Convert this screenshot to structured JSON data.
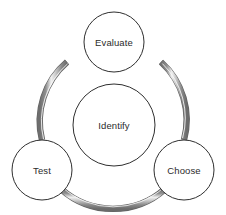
{
  "diagram": {
    "type": "cycle-diagram",
    "title": "",
    "background_color": "#ffffff",
    "stroke_color": "#2f2f2f",
    "text_color": "#2b2b2b",
    "ring": {
      "name": "connecting-ring",
      "color_dark": "#6e6e6e",
      "color_mid": "#9a9a9a",
      "color_highlight": "#f2f2f2",
      "center_x": 113,
      "center_y": 118,
      "radius": 78,
      "band_width": 6,
      "segments": [
        {
          "name": "arc-evaluate-to-choose",
          "start_angle": -52,
          "end_angle": 52
        },
        {
          "name": "arc-choose-to-test",
          "start_angle": 68,
          "end_angle": 112
        },
        {
          "name": "arc-test-to-evaluate",
          "start_angle": 128,
          "end_angle": 232
        }
      ]
    },
    "center_node": {
      "name": "identify",
      "label": "Identify",
      "cx": 114,
      "cy": 125,
      "r": 41
    },
    "nodes": [
      {
        "name": "evaluate",
        "label": "Evaluate",
        "cx": 114,
        "cy": 42,
        "r": 30,
        "position": "top"
      },
      {
        "name": "test",
        "label": "Test",
        "cx": 42,
        "cy": 170,
        "r": 30,
        "position": "bottom-left"
      },
      {
        "name": "choose",
        "label": "Choose",
        "cx": 184,
        "cy": 170,
        "r": 30,
        "position": "bottom-right"
      }
    ]
  }
}
